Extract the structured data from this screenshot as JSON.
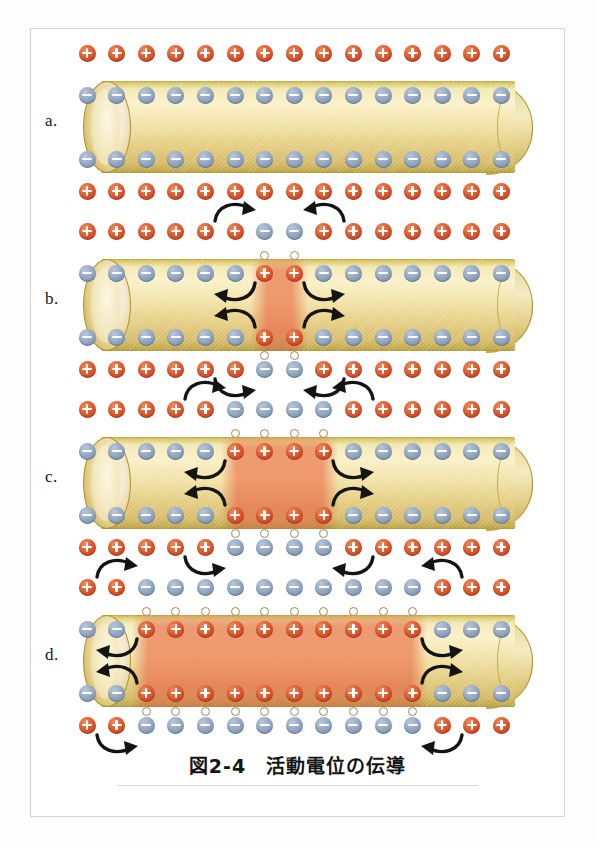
{
  "figure": {
    "caption": "図2-4　活動電位の伝導",
    "caption_number": "図2-4",
    "caption_title": "活動電位の伝導",
    "border_color": "#c9d8e4",
    "background": "#ffffff"
  },
  "colors": {
    "positive_ion": "#d4472a",
    "negative_ion": "#8fa3bd",
    "axon_membrane": "#e9d38a",
    "axon_highlight": "#faf1c8",
    "depolarized_zone": "#e8805a",
    "arrow": "#1a1a1a",
    "ion_channel": "#ffffff",
    "label_text": "#17171a"
  },
  "legend": {
    "positive_symbol": "+",
    "negative_symbol": "−",
    "positive_meaning": "positive-charge",
    "negative_meaning": "negative-charge",
    "channel_meaning": "open-ion-channel"
  },
  "layout": {
    "ion_count_per_row": 15,
    "rows_per_panel": 4,
    "row_names": [
      "outside-top",
      "inside-top",
      "inside-bottom",
      "outside-bottom"
    ]
  },
  "panels": [
    {
      "id": "a",
      "label": "a.",
      "state": "resting-membrane-potential",
      "depolarized_start": null,
      "depolarized_end": null,
      "rows": {
        "outside_top": [
          "+",
          "+",
          "+",
          "+",
          "+",
          "+",
          "+",
          "+",
          "+",
          "+",
          "+",
          "+",
          "+",
          "+",
          "+"
        ],
        "inside_top": [
          "-",
          "-",
          "-",
          "-",
          "-",
          "-",
          "-",
          "-",
          "-",
          "-",
          "-",
          "-",
          "-",
          "-",
          "-"
        ],
        "inside_bottom": [
          "-",
          "-",
          "-",
          "-",
          "-",
          "-",
          "-",
          "-",
          "-",
          "-",
          "-",
          "-",
          "-",
          "-",
          "-"
        ],
        "outside_bottom": [
          "+",
          "+",
          "+",
          "+",
          "+",
          "+",
          "+",
          "+",
          "+",
          "+",
          "+",
          "+",
          "+",
          "+",
          "+"
        ]
      },
      "channels": [],
      "arrows": []
    },
    {
      "id": "b",
      "label": "b.",
      "state": "action-potential-initiated",
      "depolarized_start": 7,
      "depolarized_end": 8,
      "rows": {
        "outside_top": [
          "+",
          "+",
          "+",
          "+",
          "+",
          "+",
          "-",
          "-",
          "+",
          "+",
          "+",
          "+",
          "+",
          "+",
          "+"
        ],
        "inside_top": [
          "-",
          "-",
          "-",
          "-",
          "-",
          "-",
          "+",
          "+",
          "-",
          "-",
          "-",
          "-",
          "-",
          "-",
          "-"
        ],
        "inside_bottom": [
          "-",
          "-",
          "-",
          "-",
          "-",
          "-",
          "+",
          "+",
          "-",
          "-",
          "-",
          "-",
          "-",
          "-",
          "-"
        ],
        "outside_bottom": [
          "+",
          "+",
          "+",
          "+",
          "+",
          "+",
          "-",
          "-",
          "+",
          "+",
          "+",
          "+",
          "+",
          "+",
          "+"
        ]
      },
      "channels": [
        7,
        8
      ],
      "arrows": [
        {
          "row": "outside-top",
          "direction": "right",
          "position": 6
        },
        {
          "row": "outside-top",
          "direction": "left",
          "position": 9
        },
        {
          "row": "inside-top",
          "direction": "left",
          "position": 6
        },
        {
          "row": "inside-top",
          "direction": "right",
          "position": 9
        },
        {
          "row": "inside-bottom",
          "direction": "left",
          "position": 6
        },
        {
          "row": "inside-bottom",
          "direction": "right",
          "position": 9
        },
        {
          "row": "outside-bottom",
          "direction": "right",
          "position": 6
        },
        {
          "row": "outside-bottom",
          "direction": "left",
          "position": 9
        }
      ]
    },
    {
      "id": "c",
      "label": "c.",
      "state": "action-potential-spreading",
      "depolarized_start": 6,
      "depolarized_end": 9,
      "rows": {
        "outside_top": [
          "+",
          "+",
          "+",
          "+",
          "+",
          "-",
          "-",
          "-",
          "-",
          "+",
          "+",
          "+",
          "+",
          "+",
          "+"
        ],
        "inside_top": [
          "-",
          "-",
          "-",
          "-",
          "-",
          "+",
          "+",
          "+",
          "+",
          "-",
          "-",
          "-",
          "-",
          "-",
          "-"
        ],
        "inside_bottom": [
          "-",
          "-",
          "-",
          "-",
          "-",
          "+",
          "+",
          "+",
          "+",
          "-",
          "-",
          "-",
          "-",
          "-",
          "-"
        ],
        "outside_bottom": [
          "+",
          "+",
          "+",
          "+",
          "+",
          "-",
          "-",
          "-",
          "-",
          "+",
          "+",
          "+",
          "+",
          "+",
          "+"
        ]
      },
      "channels": [
        6,
        7,
        8,
        9
      ],
      "arrows": [
        {
          "row": "outside-top",
          "direction": "right",
          "position": 5
        },
        {
          "row": "outside-top",
          "direction": "left",
          "position": 10
        },
        {
          "row": "inside-top",
          "direction": "left",
          "position": 5
        },
        {
          "row": "inside-top",
          "direction": "right",
          "position": 10
        },
        {
          "row": "inside-bottom",
          "direction": "left",
          "position": 5
        },
        {
          "row": "inside-bottom",
          "direction": "right",
          "position": 10
        },
        {
          "row": "outside-bottom",
          "direction": "right",
          "position": 5
        },
        {
          "row": "outside-bottom",
          "direction": "left",
          "position": 10
        }
      ]
    },
    {
      "id": "d",
      "label": "d.",
      "state": "action-potential-propagated",
      "depolarized_start": 3,
      "depolarized_end": 12,
      "rows": {
        "outside_top": [
          "+",
          "+",
          "-",
          "-",
          "-",
          "-",
          "-",
          "-",
          "-",
          "-",
          "-",
          "-",
          "+",
          "+",
          "+"
        ],
        "inside_top": [
          "-",
          "-",
          "+",
          "+",
          "+",
          "+",
          "+",
          "+",
          "+",
          "+",
          "+",
          "+",
          "-",
          "-",
          "-"
        ],
        "inside_bottom": [
          "-",
          "-",
          "+",
          "+",
          "+",
          "+",
          "+",
          "+",
          "+",
          "+",
          "+",
          "+",
          "-",
          "-",
          "-"
        ],
        "outside_bottom": [
          "+",
          "+",
          "-",
          "-",
          "-",
          "-",
          "-",
          "-",
          "-",
          "-",
          "-",
          "-",
          "+",
          "+",
          "+"
        ]
      },
      "channels": [
        3,
        4,
        5,
        6,
        7,
        8,
        9,
        10,
        11,
        12
      ],
      "arrows": [
        {
          "row": "outside-top",
          "direction": "right",
          "position": 2
        },
        {
          "row": "outside-top",
          "direction": "left",
          "position": 13
        },
        {
          "row": "inside-top",
          "direction": "left",
          "position": 2
        },
        {
          "row": "inside-top",
          "direction": "right",
          "position": 13
        },
        {
          "row": "inside-bottom",
          "direction": "left",
          "position": 2
        },
        {
          "row": "inside-bottom",
          "direction": "right",
          "position": 13
        },
        {
          "row": "outside-bottom",
          "direction": "right",
          "position": 2
        },
        {
          "row": "outside-bottom",
          "direction": "left",
          "position": 13
        }
      ]
    }
  ]
}
